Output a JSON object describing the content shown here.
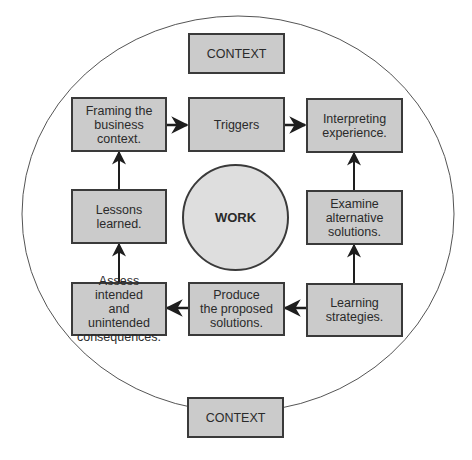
{
  "diagram": {
    "colors": {
      "box_fill": "#cbcbcb",
      "box_border": "#3a3a3a",
      "circle_fill": "#dedede",
      "outer_ellipse_stroke": "#555555",
      "text": "#2a2a2a",
      "background": "#ffffff"
    },
    "context_top": {
      "label": "CONTEXT"
    },
    "context_bottom": {
      "label": "CONTEXT"
    },
    "center": {
      "label": "WORK"
    },
    "steps": [
      {
        "id": "framing",
        "lines": [
          "Framing the",
          "business context."
        ]
      },
      {
        "id": "triggers",
        "lines": [
          "Triggers"
        ]
      },
      {
        "id": "interpreting",
        "lines": [
          "Interpreting",
          "experience."
        ]
      },
      {
        "id": "examine",
        "lines": [
          "Examine",
          "alternative",
          "solutions."
        ]
      },
      {
        "id": "learning",
        "lines": [
          "Learning",
          "strategies."
        ]
      },
      {
        "id": "produce",
        "lines": [
          "Produce",
          "the proposed",
          "solutions."
        ]
      },
      {
        "id": "assess",
        "lines": [
          "Assess intended",
          "and unintended",
          "consequences."
        ]
      },
      {
        "id": "lessons",
        "lines": [
          "Lessons",
          "learned."
        ]
      }
    ],
    "flow": [
      {
        "from": "framing",
        "to": "triggers",
        "direction": "right"
      },
      {
        "from": "triggers",
        "to": "interpreting",
        "direction": "right"
      },
      {
        "from": "examine",
        "to": "interpreting",
        "direction": "up"
      },
      {
        "from": "learning",
        "to": "examine",
        "direction": "up"
      },
      {
        "from": "learning",
        "to": "produce",
        "direction": "left"
      },
      {
        "from": "produce",
        "to": "assess",
        "direction": "left"
      },
      {
        "from": "assess",
        "to": "lessons",
        "direction": "up"
      },
      {
        "from": "lessons",
        "to": "framing",
        "direction": "up"
      }
    ]
  }
}
